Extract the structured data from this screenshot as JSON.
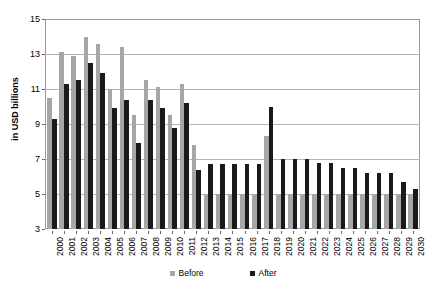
{
  "chart_data": {
    "type": "bar",
    "title": "",
    "xlabel": "",
    "ylabel": "in USD billions",
    "ylim": [
      3,
      15
    ],
    "yticks": [
      3,
      5,
      7,
      9,
      11,
      13,
      15
    ],
    "grid": true,
    "legend_position": "bottom",
    "categories": [
      "2000",
      "2001",
      "2002",
      "2003",
      "2004",
      "2005",
      "2006",
      "2007",
      "2008",
      "2009",
      "2010",
      "2011",
      "2012",
      "2013",
      "2014",
      "2015",
      "2016",
      "2017",
      "2018",
      "2019",
      "2020",
      "2021",
      "2022",
      "2023",
      "2024",
      "2025",
      "2026",
      "2027",
      "2028",
      "2029",
      "2030"
    ],
    "series": [
      {
        "name": "Before",
        "color": "#a6a6a6",
        "values": [
          10.5,
          13.1,
          12.9,
          14.0,
          13.6,
          11.0,
          13.4,
          9.5,
          11.5,
          11.1,
          9.5,
          11.3,
          7.8,
          5.0,
          5.0,
          5.0,
          5.0,
          5.0,
          8.3,
          5.0,
          5.0,
          5.0,
          5.0,
          5.0,
          5.0,
          5.0,
          5.0,
          5.0,
          5.0,
          5.0,
          5.0
        ]
      },
      {
        "name": "After",
        "color": "#1a1a1a",
        "values": [
          9.3,
          11.3,
          11.5,
          12.5,
          11.9,
          9.9,
          10.4,
          7.9,
          10.4,
          9.9,
          8.8,
          10.2,
          6.4,
          6.7,
          6.7,
          6.7,
          6.7,
          6.7,
          10.0,
          7.0,
          7.0,
          7.0,
          6.8,
          6.8,
          6.5,
          6.5,
          6.2,
          6.2,
          6.2,
          5.7,
          5.3
        ]
      }
    ]
  },
  "legend": {
    "items": [
      {
        "label": "Before"
      },
      {
        "label": "After"
      }
    ]
  }
}
